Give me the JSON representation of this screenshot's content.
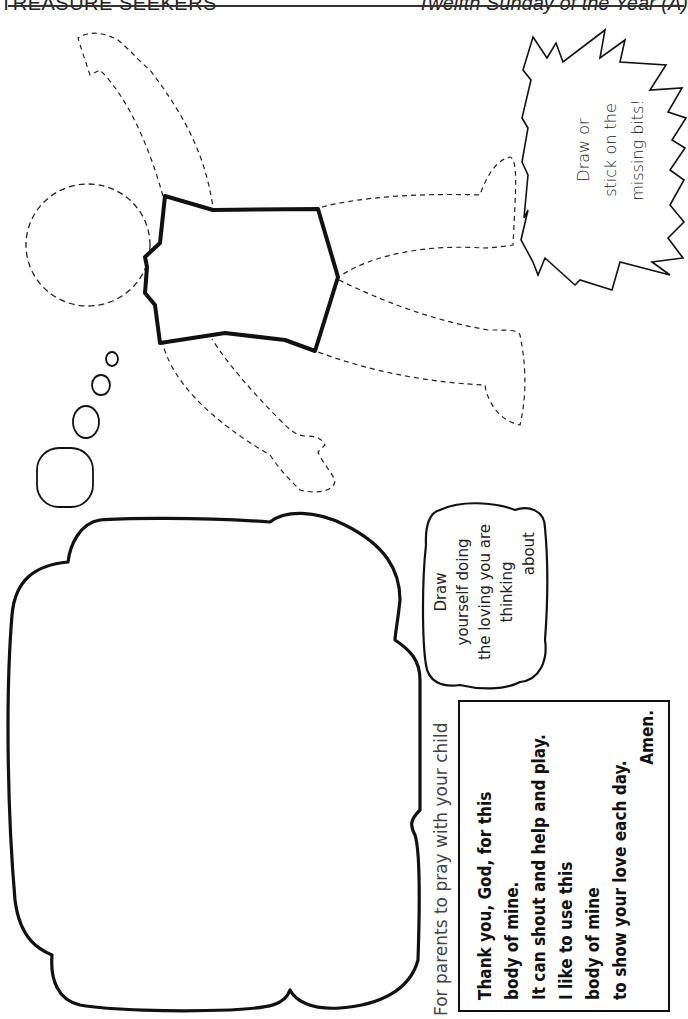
{
  "header": {
    "series_title": "TREASURE SEEKERS",
    "occasion": "Twelfth Sunday of the Year (A)"
  },
  "activity": {
    "burst_instruction": [
      "Draw or",
      "stick on the",
      "missing bits!"
    ],
    "cloud_instruction": [
      "Draw",
      "yourself doing",
      "the loving you are",
      "thinking",
      "about"
    ],
    "figure": "dashed-outline child figure with solid torso",
    "thought_bubbles": 4,
    "drawing_area": "large blank thought cloud"
  },
  "prayer": {
    "label": "For parents to pray with your child",
    "lines": [
      "Thank you, God, for this",
      "body of mine.",
      "It can shout and help and play.",
      "I like to use this",
      "body of mine",
      "to show your love each day."
    ],
    "closing": "Amen."
  },
  "colors": {
    "ink": "#111111",
    "paper": "#ffffff"
  }
}
